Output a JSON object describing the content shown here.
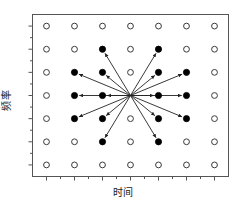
{
  "figure": {
    "title": "",
    "xlabel": "时间",
    "ylabel": "频率",
    "frame_color": "#555555",
    "marker_color": "#000000",
    "arrow_color": "#222222"
  },
  "chart_data": {
    "type": "scatter",
    "title": "",
    "xlabel": "时间",
    "ylabel": "频率",
    "xlim": [
      -3.5,
      3.5
    ],
    "ylim": [
      -3.5,
      3.5
    ],
    "grid": false,
    "legend": null,
    "x_ticks": [
      -3,
      -2,
      -1,
      0,
      1,
      2,
      3
    ],
    "y_ticks": [
      -3,
      -2,
      -1,
      0,
      1,
      2,
      3
    ],
    "x_ticklabels": [
      "",
      "",
      "",
      "",
      "",
      "",
      ""
    ],
    "y_ticklabels": [
      "",
      "",
      "",
      "",
      "",
      "",
      ""
    ],
    "minor_ticks": true,
    "series": [
      {
        "name": "lattice-points",
        "marker": "open-circle",
        "marker_size": 4,
        "points": [
          {
            "x": -3,
            "y": 3
          },
          {
            "x": -2,
            "y": 3
          },
          {
            "x": -1,
            "y": 3
          },
          {
            "x": 0,
            "y": 3
          },
          {
            "x": 1,
            "y": 3
          },
          {
            "x": 2,
            "y": 3
          },
          {
            "x": 3,
            "y": 3
          },
          {
            "x": -3,
            "y": 2
          },
          {
            "x": -2,
            "y": 2
          },
          {
            "x": 0,
            "y": 2
          },
          {
            "x": 2,
            "y": 2
          },
          {
            "x": 3,
            "y": 2
          },
          {
            "x": -3,
            "y": 1
          },
          {
            "x": 0,
            "y": 1
          },
          {
            "x": 3,
            "y": 1
          },
          {
            "x": -3,
            "y": 0
          },
          {
            "x": 3,
            "y": 0
          },
          {
            "x": -3,
            "y": -1
          },
          {
            "x": 0,
            "y": -1
          },
          {
            "x": 3,
            "y": -1
          },
          {
            "x": -3,
            "y": -2
          },
          {
            "x": -2,
            "y": -2
          },
          {
            "x": 0,
            "y": -2
          },
          {
            "x": 2,
            "y": -2
          },
          {
            "x": 3,
            "y": -2
          },
          {
            "x": -3,
            "y": -3
          },
          {
            "x": -2,
            "y": -3
          },
          {
            "x": -1,
            "y": -3
          },
          {
            "x": 0,
            "y": -3
          },
          {
            "x": 1,
            "y": -3
          },
          {
            "x": 2,
            "y": -3
          },
          {
            "x": 3,
            "y": -3
          }
        ]
      },
      {
        "name": "spread-targets",
        "marker": "filled-circle",
        "marker_size": 4,
        "points": [
          {
            "x": -1,
            "y": 2
          },
          {
            "x": 1,
            "y": 2
          },
          {
            "x": -2,
            "y": 1
          },
          {
            "x": -1,
            "y": 1
          },
          {
            "x": 1,
            "y": 1
          },
          {
            "x": 2,
            "y": 1
          },
          {
            "x": -2,
            "y": 0
          },
          {
            "x": -1,
            "y": 0
          },
          {
            "x": 1,
            "y": 0
          },
          {
            "x": 2,
            "y": 0
          },
          {
            "x": -2,
            "y": -1
          },
          {
            "x": -1,
            "y": -1
          },
          {
            "x": 1,
            "y": -1
          },
          {
            "x": 2,
            "y": -1
          },
          {
            "x": -1,
            "y": -2
          },
          {
            "x": 1,
            "y": -2
          }
        ]
      }
    ],
    "arrows": {
      "name": "spreading-arrows",
      "origin": {
        "x": 0,
        "y": 0
      },
      "targets": [
        {
          "x": -1,
          "y": 2
        },
        {
          "x": 1,
          "y": 2
        },
        {
          "x": -2,
          "y": 1
        },
        {
          "x": -1,
          "y": 1
        },
        {
          "x": 1,
          "y": 1
        },
        {
          "x": 2,
          "y": 1
        },
        {
          "x": -2,
          "y": 0
        },
        {
          "x": -1,
          "y": 0
        },
        {
          "x": 1,
          "y": 0
        },
        {
          "x": 2,
          "y": 0
        },
        {
          "x": -2,
          "y": -1
        },
        {
          "x": -1,
          "y": -1
        },
        {
          "x": 1,
          "y": -1
        },
        {
          "x": 2,
          "y": -1
        },
        {
          "x": -1,
          "y": -2
        },
        {
          "x": 1,
          "y": -2
        }
      ]
    }
  }
}
